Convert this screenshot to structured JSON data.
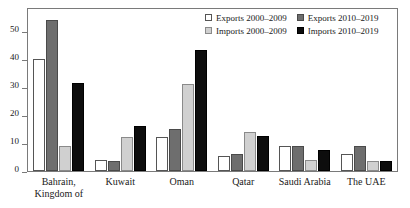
{
  "chart_data": {
    "type": "bar",
    "title": "",
    "subtitle": "",
    "xlabel": "",
    "ylabel": "",
    "ylim": [
      0,
      58
    ],
    "yticks": [
      0,
      10,
      20,
      30,
      40,
      50
    ],
    "grid": false,
    "legend_position": "top-right",
    "categories": [
      "Bahrain, Kingdom of",
      "Kuwait",
      "Oman",
      "Qatar",
      "Saudi Arabia",
      "The UAE"
    ],
    "category_lines": [
      [
        "Bahrain,",
        "Kingdom of"
      ],
      [
        "Kuwait"
      ],
      [
        "Oman"
      ],
      [
        "Qatar"
      ],
      [
        "Saudi Arabia"
      ],
      [
        "The UAE"
      ]
    ],
    "series": [
      {
        "name": "Exports 2000–2009",
        "color": "#ffffff",
        "values": [
          40,
          4,
          12,
          5.5,
          9,
          6
        ]
      },
      {
        "name": "Exports 2010–2019",
        "color": "#6e6e6e",
        "values": [
          54,
          3.5,
          15,
          6,
          9,
          9
        ]
      },
      {
        "name": "Imports 2000–2009",
        "color": "#d0d0d0",
        "values": [
          9,
          12,
          31,
          14,
          4,
          3.5
        ]
      },
      {
        "name": "Imports 2010–2019",
        "color": "#0d0d0d",
        "values": [
          31.5,
          16,
          43.5,
          12.5,
          7.5,
          3.5
        ]
      }
    ],
    "series_draw_order": [
      0,
      1,
      2,
      3
    ],
    "legend_entries": [
      {
        "label": "Exports 2000–2009",
        "swatch": "s0"
      },
      {
        "label": "Exports 2010–2019",
        "swatch": "s1"
      },
      {
        "label": "Imports 2000–2009",
        "swatch": "s2"
      },
      {
        "label": "Imports 2010–2019",
        "swatch": "s3"
      }
    ]
  }
}
